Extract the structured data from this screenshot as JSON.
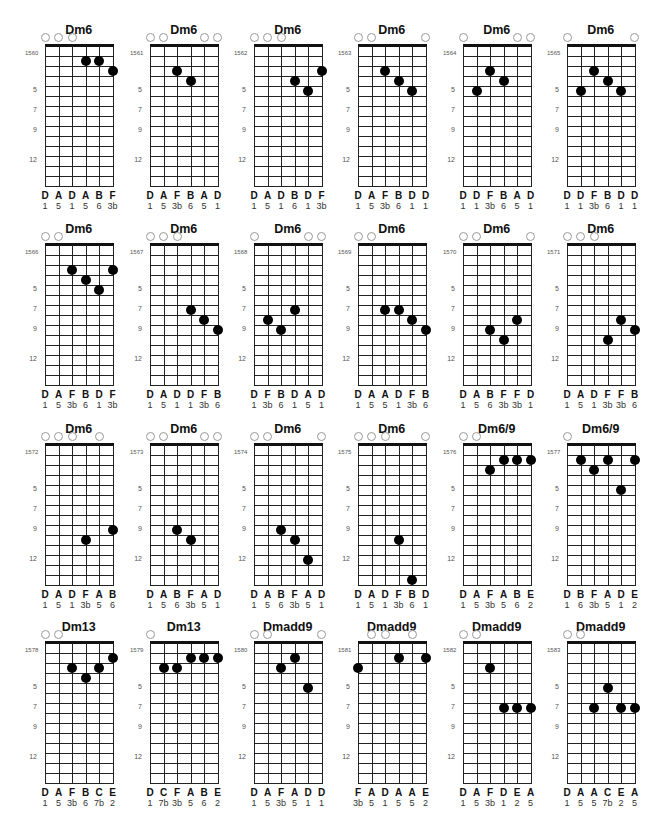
{
  "page": {
    "header_clipped": "",
    "layout": {
      "columns_x": [
        45,
        150,
        254,
        358,
        463,
        567
      ],
      "rows_nut_y": [
        46,
        245,
        445,
        643
      ],
      "string_spacing": 13.5,
      "fret_spacing": 10,
      "fret_count": 14,
      "fret_markers": [
        5,
        7,
        9,
        12
      ]
    },
    "chords": [
      {
        "id": "1560",
        "name": "Dm6",
        "open": [
          1,
          2,
          3
        ],
        "dots": [
          [
            4,
            2
          ],
          [
            5,
            2
          ],
          [
            6,
            3
          ]
        ],
        "notes": [
          "D",
          "A",
          "D",
          "A",
          "B",
          "F"
        ],
        "degrees": [
          "1",
          "5",
          "1",
          "5",
          "6",
          "3b"
        ]
      },
      {
        "id": "1561",
        "name": "Dm6",
        "open": [
          1,
          2,
          5,
          6
        ],
        "dots": [
          [
            3,
            3
          ],
          [
            4,
            4
          ]
        ],
        "notes": [
          "D",
          "A",
          "F",
          "B",
          "A",
          "D"
        ],
        "degrees": [
          "1",
          "5",
          "3b",
          "6",
          "5",
          "1"
        ]
      },
      {
        "id": "1562",
        "name": "Dm6",
        "open": [
          1,
          2,
          3
        ],
        "dots": [
          [
            4,
            4
          ],
          [
            5,
            5
          ],
          [
            6,
            3
          ]
        ],
        "notes": [
          "D",
          "A",
          "D",
          "B",
          "D",
          "F"
        ],
        "degrees": [
          "1",
          "5",
          "1",
          "6",
          "1",
          "3b"
        ]
      },
      {
        "id": "1563",
        "name": "Dm6",
        "open": [
          1,
          2,
          6
        ],
        "dots": [
          [
            3,
            3
          ],
          [
            4,
            4
          ],
          [
            5,
            5
          ]
        ],
        "notes": [
          "D",
          "A",
          "F",
          "B",
          "D",
          "D"
        ],
        "degrees": [
          "1",
          "5",
          "3b",
          "6",
          "1",
          "1"
        ]
      },
      {
        "id": "1564",
        "name": "Dm6",
        "open": [
          1,
          5,
          6
        ],
        "dots": [
          [
            2,
            5
          ],
          [
            3,
            3
          ],
          [
            4,
            4
          ]
        ],
        "notes": [
          "D",
          "D",
          "F",
          "B",
          "A",
          "D"
        ],
        "degrees": [
          "1",
          "1",
          "3b",
          "6",
          "5",
          "1"
        ]
      },
      {
        "id": "1565",
        "name": "Dm6",
        "open": [
          1,
          6
        ],
        "dots": [
          [
            2,
            5
          ],
          [
            3,
            3
          ],
          [
            4,
            4
          ],
          [
            5,
            5
          ]
        ],
        "notes": [
          "D",
          "D",
          "F",
          "B",
          "D",
          "D"
        ],
        "degrees": [
          "1",
          "1",
          "3b",
          "6",
          "1",
          "1"
        ]
      },
      {
        "id": "1566",
        "name": "Dm6",
        "open": [
          1,
          2
        ],
        "dots": [
          [
            3,
            3
          ],
          [
            4,
            4
          ],
          [
            5,
            5
          ],
          [
            6,
            3
          ]
        ],
        "notes": [
          "D",
          "A",
          "F",
          "B",
          "D",
          "F"
        ],
        "degrees": [
          "1",
          "5",
          "3b",
          "6",
          "1",
          "3b"
        ]
      },
      {
        "id": "1567",
        "name": "Dm6",
        "open": [
          1,
          2,
          3
        ],
        "dots": [
          [
            4,
            7
          ],
          [
            5,
            8
          ],
          [
            6,
            9
          ]
        ],
        "notes": [
          "D",
          "A",
          "D",
          "D",
          "F",
          "B"
        ],
        "degrees": [
          "1",
          "5",
          "1",
          "1",
          "3b",
          "6"
        ]
      },
      {
        "id": "1568",
        "name": "Dm6",
        "open": [
          1,
          5,
          6
        ],
        "dots": [
          [
            2,
            8
          ],
          [
            3,
            9
          ],
          [
            4,
            7
          ]
        ],
        "notes": [
          "D",
          "F",
          "B",
          "D",
          "A",
          "D"
        ],
        "degrees": [
          "1",
          "3b",
          "6",
          "1",
          "5",
          "1"
        ]
      },
      {
        "id": "1569",
        "name": "Dm6",
        "open": [
          1,
          2
        ],
        "dots": [
          [
            3,
            7
          ],
          [
            4,
            7
          ],
          [
            5,
            8
          ],
          [
            6,
            9
          ]
        ],
        "notes": [
          "D",
          "A",
          "A",
          "D",
          "F",
          "B"
        ],
        "degrees": [
          "1",
          "5",
          "5",
          "1",
          "3b",
          "6"
        ]
      },
      {
        "id": "1570",
        "name": "Dm6",
        "open": [
          1,
          2,
          6
        ],
        "dots": [
          [
            3,
            9
          ],
          [
            4,
            10
          ],
          [
            5,
            8
          ]
        ],
        "notes": [
          "D",
          "A",
          "B",
          "F",
          "F",
          "D"
        ],
        "degrees": [
          "1",
          "5",
          "6",
          "3b",
          "3b",
          "1"
        ]
      },
      {
        "id": "1571",
        "name": "Dm6",
        "open": [
          1,
          2,
          3
        ],
        "dots": [
          [
            4,
            10
          ],
          [
            5,
            8
          ],
          [
            6,
            9
          ]
        ],
        "notes": [
          "D",
          "A",
          "D",
          "F",
          "F",
          "B"
        ],
        "degrees": [
          "1",
          "5",
          "1",
          "3b",
          "3b",
          "6"
        ]
      },
      {
        "id": "1572",
        "name": "Dm6",
        "open": [
          1,
          2,
          3,
          5
        ],
        "dots": [
          [
            4,
            10
          ],
          [
            6,
            9
          ]
        ],
        "notes": [
          "D",
          "A",
          "D",
          "F",
          "A",
          "B"
        ],
        "degrees": [
          "1",
          "5",
          "1",
          "3b",
          "5",
          "6"
        ]
      },
      {
        "id": "1573",
        "name": "Dm6",
        "open": [
          1,
          2,
          5,
          6
        ],
        "dots": [
          [
            3,
            9
          ],
          [
            4,
            10
          ]
        ],
        "notes": [
          "D",
          "A",
          "B",
          "F",
          "A",
          "D"
        ],
        "degrees": [
          "1",
          "5",
          "6",
          "3b",
          "5",
          "1"
        ]
      },
      {
        "id": "1574",
        "name": "Dm6",
        "open": [
          1,
          2,
          6
        ],
        "dots": [
          [
            3,
            9
          ],
          [
            4,
            10
          ],
          [
            5,
            12
          ]
        ],
        "notes": [
          "D",
          "A",
          "B",
          "F",
          "A",
          "D"
        ],
        "degrees": [
          "1",
          "5",
          "6",
          "3b",
          "5",
          "1"
        ]
      },
      {
        "id": "1575",
        "name": "Dm6",
        "open": [
          1,
          2,
          3,
          6
        ],
        "dots": [
          [
            4,
            10
          ],
          [
            5,
            14
          ]
        ],
        "notes": [
          "D",
          "A",
          "D",
          "F",
          "B",
          "D"
        ],
        "degrees": [
          "1",
          "5",
          "1",
          "3b",
          "6",
          "1"
        ]
      },
      {
        "id": "1576",
        "name": "Dm6/9",
        "open": [
          1,
          2
        ],
        "dots": [
          [
            3,
            3
          ],
          [
            4,
            2
          ],
          [
            5,
            2
          ],
          [
            6,
            2
          ]
        ],
        "notes": [
          "D",
          "A",
          "F",
          "A",
          "B",
          "E"
        ],
        "degrees": [
          "1",
          "5",
          "3b",
          "5",
          "6",
          "2"
        ]
      },
      {
        "id": "1577",
        "name": "Dm6/9",
        "open": [
          1
        ],
        "dots": [
          [
            2,
            2
          ],
          [
            3,
            3
          ],
          [
            4,
            2
          ],
          [
            5,
            5
          ],
          [
            6,
            2
          ]
        ],
        "notes": [
          "D",
          "B",
          "F",
          "A",
          "D",
          "E"
        ],
        "degrees": [
          "1",
          "6",
          "3b",
          "5",
          "1",
          "2"
        ]
      },
      {
        "id": "1578",
        "name": "Dm13",
        "open": [
          1,
          2
        ],
        "dots": [
          [
            3,
            3
          ],
          [
            4,
            4
          ],
          [
            5,
            3
          ],
          [
            6,
            2
          ]
        ],
        "notes": [
          "D",
          "A",
          "F",
          "B",
          "C",
          "E"
        ],
        "degrees": [
          "1",
          "5",
          "3b",
          "6",
          "7b",
          "2"
        ]
      },
      {
        "id": "1579",
        "name": "Dm13",
        "open": [
          1
        ],
        "dots": [
          [
            2,
            3
          ],
          [
            3,
            3
          ],
          [
            4,
            2
          ],
          [
            5,
            2
          ],
          [
            6,
            2
          ]
        ],
        "notes": [
          "D",
          "C",
          "F",
          "A",
          "B",
          "E"
        ],
        "degrees": [
          "1",
          "7b",
          "3b",
          "5",
          "6",
          "2"
        ]
      },
      {
        "id": "1580",
        "name": "Dmadd9",
        "open": [
          1,
          2,
          6
        ],
        "dots": [
          [
            3,
            3
          ],
          [
            4,
            2
          ],
          [
            5,
            5
          ]
        ],
        "notes": [
          "D",
          "A",
          "F",
          "A",
          "D",
          "D"
        ],
        "degrees": [
          "1",
          "5",
          "3b",
          "5",
          "1",
          "1"
        ]
      },
      {
        "id": "1581",
        "name": "Dmadd9",
        "open": [
          2,
          3,
          5
        ],
        "dots": [
          [
            1,
            3
          ],
          [
            4,
            2
          ],
          [
            6,
            2
          ]
        ],
        "notes": [
          "F",
          "A",
          "D",
          "A",
          "A",
          "E"
        ],
        "degrees": [
          "3b",
          "5",
          "1",
          "5",
          "5",
          "2"
        ]
      },
      {
        "id": "1582",
        "name": "Dmadd9",
        "open": [
          1,
          2
        ],
        "dots": [
          [
            3,
            3
          ],
          [
            4,
            7
          ],
          [
            5,
            7
          ],
          [
            6,
            7
          ]
        ],
        "notes": [
          "D",
          "A",
          "F",
          "D",
          "E",
          "A"
        ],
        "degrees": [
          "1",
          "5",
          "3b",
          "1",
          "2",
          "5"
        ]
      },
      {
        "id": "1583",
        "name": "Dmadd9",
        "open": [
          1,
          2
        ],
        "dots": [
          [
            3,
            7
          ],
          [
            4,
            5
          ],
          [
            5,
            7
          ],
          [
            6,
            7
          ]
        ],
        "notes": [
          "D",
          "A",
          "A",
          "C",
          "E",
          "A"
        ],
        "degrees": [
          "1",
          "5",
          "5",
          "7b",
          "2",
          "5"
        ]
      }
    ]
  }
}
